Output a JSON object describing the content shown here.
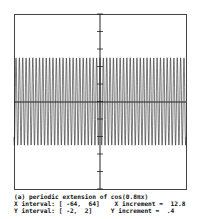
{
  "chart_data": {
    "type": "line",
    "title": "(a) periodic extension of cos(0.8πx)",
    "function": "cos(0.8*pi*x)",
    "xlim": [
      -64,
      64
    ],
    "ylim": [
      -2,
      2
    ],
    "x_increment": 12.8,
    "y_increment": 0.4,
    "grid": false,
    "series": [
      {
        "name": "cos(0.8πx)",
        "amplitude": 1,
        "angular_frequency_over_pi": 0.8
      }
    ]
  },
  "caption": {
    "line1": "(a) periodic extension of cos(0.8πx)",
    "line2": "X interval: [ -64,  64]    X increment =  12.8",
    "line3": "Y interval: [ -2,  2]     Y increment =  .4"
  },
  "colors": {
    "axis": "#333333",
    "curve": "#222222",
    "background": "#ffffff"
  }
}
